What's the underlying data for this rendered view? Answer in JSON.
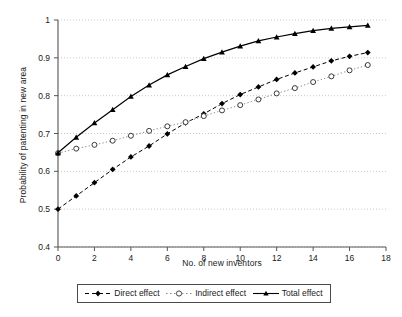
{
  "chart_data": {
    "type": "line",
    "title": "",
    "xlabel": "No. of new inventors",
    "ylabel": "Probability of patenting in new area",
    "xlim": [
      0,
      18
    ],
    "ylim": [
      0.4,
      1
    ],
    "xticks": [
      0,
      2,
      4,
      6,
      8,
      10,
      12,
      14,
      16,
      18
    ],
    "xtick_labels": [
      "0",
      "2",
      "4",
      "6",
      "8",
      "10",
      "12",
      "14",
      "16",
      "18"
    ],
    "yticks": [
      0.4,
      0.5,
      0.6,
      0.7,
      0.8,
      0.9,
      1
    ],
    "ytick_labels": [
      "0.4",
      "0.5",
      "0.6",
      "0.7",
      "0.8",
      "0.9",
      "1"
    ],
    "grid": "horizontal-dotted",
    "legend_position": "below-plot",
    "x": [
      0,
      1,
      2,
      3,
      4,
      5,
      6,
      7,
      8,
      9,
      10,
      11,
      12,
      13,
      14,
      15,
      16,
      17
    ],
    "series": [
      {
        "name": "Direct effect",
        "marker": "filled-diamond",
        "line_style": "dashed",
        "color": "#000000",
        "values": [
          0.5,
          0.535,
          0.57,
          0.605,
          0.638,
          0.667,
          0.699,
          0.728,
          0.752,
          0.779,
          0.803,
          0.823,
          0.843,
          0.86,
          0.876,
          0.892,
          0.904,
          0.914
        ]
      },
      {
        "name": "Indirect effect",
        "marker": "open-circle",
        "line_style": "dotted",
        "color": "#8a8a8a",
        "values": [
          0.648,
          0.66,
          0.67,
          0.681,
          0.694,
          0.707,
          0.719,
          0.73,
          0.746,
          0.761,
          0.775,
          0.79,
          0.806,
          0.82,
          0.836,
          0.851,
          0.867,
          0.881
        ]
      },
      {
        "name": "Total effect",
        "marker": "filled-triangle",
        "line_style": "solid",
        "color": "#000000",
        "values": [
          0.649,
          0.69,
          0.728,
          0.763,
          0.798,
          0.828,
          0.855,
          0.877,
          0.898,
          0.915,
          0.931,
          0.945,
          0.955,
          0.964,
          0.972,
          0.978,
          0.982,
          0.986
        ]
      }
    ]
  },
  "legend": {
    "items": [
      {
        "label": "Direct effect"
      },
      {
        "label": "Indirect effect"
      },
      {
        "label": "Total effect"
      }
    ]
  },
  "colors": {
    "axis": "#555555",
    "grid": "#bbbbbb",
    "direct": "#000000",
    "indirect": "#8a8a8a",
    "total": "#000000",
    "background": "#ffffff"
  }
}
